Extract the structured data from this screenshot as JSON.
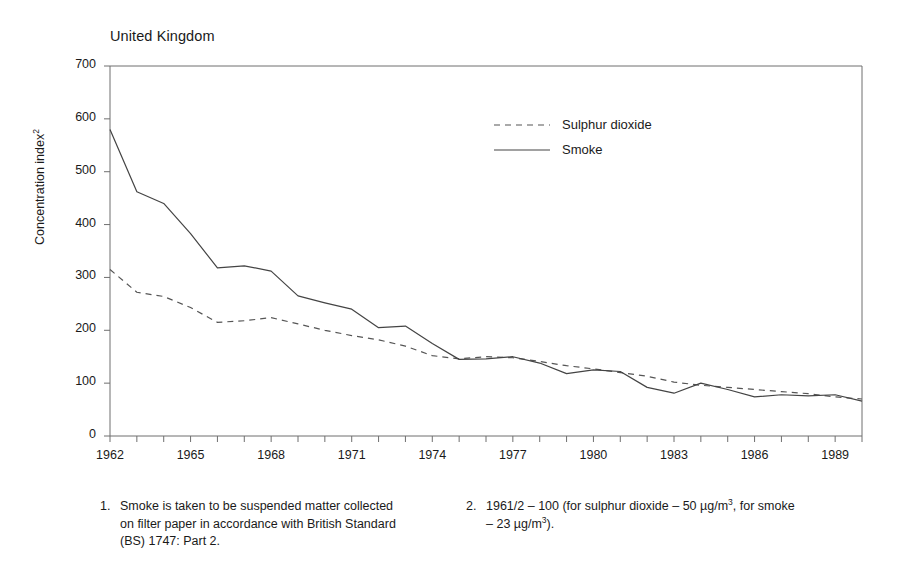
{
  "chart_data": {
    "type": "line",
    "title": "United Kingdom",
    "xlabel": "",
    "ylabel": "Concentration index",
    "ylabel_sup": "2",
    "xlim": [
      1962,
      1990
    ],
    "ylim": [
      0,
      700
    ],
    "grid": false,
    "legend_position": "top-center",
    "y_ticks": [
      0,
      100,
      200,
      300,
      400,
      500,
      600,
      700
    ],
    "x_ticks": [
      1962,
      1963,
      1964,
      1965,
      1966,
      1967,
      1968,
      1969,
      1970,
      1971,
      1972,
      1973,
      1974,
      1975,
      1976,
      1977,
      1978,
      1979,
      1980,
      1981,
      1982,
      1983,
      1984,
      1985,
      1986,
      1987,
      1988,
      1989,
      1990
    ],
    "x_tick_labels": [
      "1962",
      "",
      "",
      "1965",
      "",
      "",
      "1968",
      "",
      "",
      "1971",
      "",
      "",
      "1974",
      "",
      "",
      "1977",
      "",
      "",
      "1980",
      "",
      "",
      "1983",
      "",
      "",
      "1986",
      "",
      "",
      "1989",
      ""
    ],
    "x": [
      1962,
      1963,
      1964,
      1965,
      1966,
      1967,
      1968,
      1969,
      1970,
      1971,
      1972,
      1973,
      1974,
      1975,
      1976,
      1977,
      1978,
      1979,
      1980,
      1981,
      1982,
      1983,
      1984,
      1985,
      1986,
      1987,
      1988,
      1989,
      1990
    ],
    "series": [
      {
        "name": "Sulphur dioxide",
        "style": "dashed",
        "color": "#555555",
        "values": [
          315,
          272,
          264,
          243,
          215,
          218,
          224,
          212,
          200,
          190,
          182,
          170,
          152,
          146,
          150,
          148,
          141,
          133,
          127,
          120,
          113,
          102,
          96,
          92,
          88,
          84,
          80,
          74,
          70
        ]
      },
      {
        "name": "Smoke",
        "style": "solid",
        "color": "#444444",
        "values": [
          580,
          462,
          440,
          383,
          318,
          322,
          312,
          265,
          252,
          240,
          205,
          208,
          175,
          145,
          146,
          150,
          138,
          118,
          125,
          122,
          92,
          81,
          100,
          88,
          74,
          78,
          76,
          78,
          66
        ]
      }
    ]
  },
  "footnotes": [
    {
      "number": "1.",
      "text": "Smoke is taken to be suspended matter collected on filter paper in accordance with British Standard (BS) 1747: Part 2."
    },
    {
      "number": "2.",
      "text_before": "1961/2 – 100 (for sulphur dioxide – 50 µg/m",
      "sup_1": "3",
      "text_middle": ", for smoke – 23 µg/m",
      "sup_2": "3",
      "text_after": ")."
    }
  ]
}
